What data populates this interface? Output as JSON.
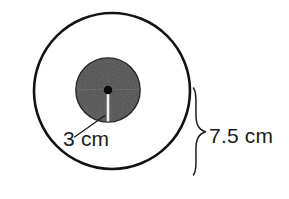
{
  "figure": {
    "background_color": "#ffffff",
    "outline_color": "#121212",
    "inner_disk_color": "#454545",
    "center_dot_color": "#0a0a0a",
    "radius_line_color": "#f2f2f2",
    "label_color": "#1c1c1c"
  },
  "shapes": {
    "outer_circle": {
      "name": "outer-circle",
      "center_x": 112,
      "center_y": 91,
      "radius": 78,
      "stroke_width": 2.6,
      "fill": "none"
    },
    "inner_circle": {
      "name": "inner-circle",
      "center_x": 108,
      "center_y": 90,
      "radius": 32,
      "stroke_width": 1.2,
      "fill": "#454545"
    },
    "center_dot": {
      "name": "center-dot",
      "center_x": 108,
      "center_y": 90,
      "radius": 4.2
    },
    "radius_line": {
      "name": "inner-radius-line",
      "x1": 108,
      "y1": 90,
      "x2": 108,
      "y2": 121,
      "stroke_width": 2.4
    },
    "diameter_line": {
      "name": "inner-diameter-line",
      "x1": 77,
      "y1": 90,
      "x2": 139,
      "y2": 90,
      "stroke_width": 1
    },
    "leader_line": {
      "name": "leader-line-3cm",
      "x1": 75,
      "y1": 136,
      "x2": 105,
      "y2": 116,
      "stroke_width": 1.2
    },
    "brace": {
      "name": "dimension-brace",
      "top_y": 88,
      "bottom_y": 175,
      "tip_x": 206,
      "tip_y": 132,
      "spine_x": 195,
      "stroke_width": 1.4
    }
  },
  "labels": {
    "inner_radius": {
      "text": "3 cm",
      "value": 3,
      "unit": "cm",
      "refers_to": "inner-circle-radius"
    },
    "outer_radius": {
      "text": "7.5 cm",
      "value": 7.5,
      "unit": "cm",
      "refers_to": "outer-circle-radius"
    }
  }
}
